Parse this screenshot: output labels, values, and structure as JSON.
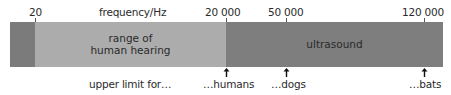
{
  "axis": {
    "title": "frequency/Hz",
    "ticks": [
      {
        "label": "20",
        "x": 35
      },
      {
        "label": "20 000",
        "x": 226
      },
      {
        "label": "50 000",
        "x": 286
      },
      {
        "label": "120 000",
        "x": 424
      }
    ]
  },
  "bands": [
    {
      "name": "infrasound",
      "label": "",
      "color": "#7b7b7b"
    },
    {
      "name": "human-hearing",
      "label_line1": "range of",
      "label_line2": "human hearing",
      "color": "#acacac"
    },
    {
      "name": "ultrasound",
      "label": "ultrasound",
      "color": "#7e7e7e"
    }
  ],
  "annotations": {
    "prefix": "upper limit for…",
    "markers": [
      {
        "label": "…humans",
        "x": 226
      },
      {
        "label": "…dogs",
        "x": 286
      },
      {
        "label": "…bats",
        "x": 424
      }
    ]
  }
}
